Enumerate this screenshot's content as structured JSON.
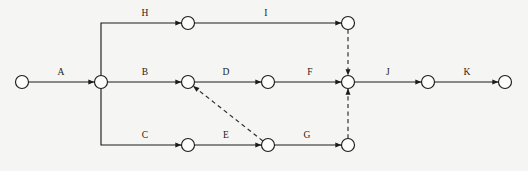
{
  "diagram": {
    "type": "activity-on-arrow-network",
    "title": "",
    "background_color": "#f5f5f3",
    "line_color": "#1c1c1c",
    "node_fill_color": "#fdfdfb",
    "canvas": {
      "width": 528,
      "height": 171
    },
    "node_radius": 6.5,
    "nodes": [
      {
        "id": "n1",
        "label": "",
        "x": 22,
        "y": 82
      },
      {
        "id": "n2",
        "label": "",
        "x": 101,
        "y": 82
      },
      {
        "id": "n3",
        "label": "",
        "x": 188,
        "y": 23
      },
      {
        "id": "n4",
        "label": "",
        "x": 348,
        "y": 23
      },
      {
        "id": "n5",
        "label": "",
        "x": 188,
        "y": 82
      },
      {
        "id": "n6",
        "label": "",
        "x": 268,
        "y": 82
      },
      {
        "id": "n7",
        "label": "",
        "x": 348,
        "y": 82
      },
      {
        "id": "n8",
        "label": "",
        "x": 428,
        "y": 82
      },
      {
        "id": "n9",
        "label": "",
        "x": 505,
        "y": 82
      },
      {
        "id": "n10",
        "label": "",
        "x": 188,
        "y": 145
      },
      {
        "id": "n11",
        "label": "",
        "x": 268,
        "y": 145
      },
      {
        "id": "n12",
        "label": "",
        "x": 348,
        "y": 145
      }
    ],
    "edges": [
      {
        "id": "e-A",
        "label": "A",
        "from": "n1",
        "to": "n2",
        "style": "solid",
        "shape": "straight",
        "label_x": 61,
        "label_y": 75
      },
      {
        "id": "e-H",
        "label": "H",
        "from": "n2",
        "to": "n3",
        "style": "solid",
        "shape": "elbow-up",
        "label_x": 145,
        "label_y": 16
      },
      {
        "id": "e-I",
        "label": "I",
        "from": "n3",
        "to": "n4",
        "style": "solid",
        "shape": "straight",
        "label_x": 266,
        "label_y": 16
      },
      {
        "id": "e-B",
        "label": "B",
        "from": "n2",
        "to": "n5",
        "style": "solid",
        "shape": "straight",
        "label_x": 145,
        "label_y": 75
      },
      {
        "id": "e-D",
        "label": "D",
        "from": "n5",
        "to": "n6",
        "style": "solid",
        "shape": "straight",
        "label_x": 226,
        "label_y": 75
      },
      {
        "id": "e-F",
        "label": "F",
        "from": "n6",
        "to": "n7",
        "style": "solid",
        "shape": "straight",
        "label_x": 310,
        "label_y": 75
      },
      {
        "id": "e-J",
        "label": "J",
        "from": "n7",
        "to": "n8",
        "style": "solid",
        "shape": "straight",
        "label_x": 388,
        "label_y": 75
      },
      {
        "id": "e-K",
        "label": "K",
        "from": "n8",
        "to": "n9",
        "style": "solid",
        "shape": "straight",
        "label_x": 467,
        "label_y": 75
      },
      {
        "id": "e-C",
        "label": "C",
        "from": "n2",
        "to": "n10",
        "style": "solid",
        "shape": "elbow-down",
        "label_x": 145,
        "label_y": 138
      },
      {
        "id": "e-E",
        "label": "E",
        "from": "n10",
        "to": "n11",
        "style": "solid",
        "shape": "straight",
        "label_x": 226,
        "label_y": 138
      },
      {
        "id": "e-G",
        "label": "G",
        "from": "n11",
        "to": "n12",
        "style": "solid",
        "shape": "straight",
        "label_x": 307,
        "label_y": 138
      },
      {
        "id": "e-dummy-1",
        "label": "",
        "from": "n11",
        "to": "n5",
        "style": "dashed",
        "shape": "diagonal",
        "label_x": 0,
        "label_y": 0
      },
      {
        "id": "e-dummy-2",
        "label": "",
        "from": "n4",
        "to": "n7",
        "style": "dashed",
        "shape": "vertical",
        "label_x": 0,
        "label_y": 0
      },
      {
        "id": "e-dummy-3",
        "label": "",
        "from": "n12",
        "to": "n7",
        "style": "dashed",
        "shape": "vertical",
        "label_x": 0,
        "label_y": 0
      }
    ],
    "labels": [
      "A",
      "B",
      "C",
      "D",
      "E",
      "F",
      "G",
      "H",
      "I",
      "J",
      "K"
    ]
  }
}
